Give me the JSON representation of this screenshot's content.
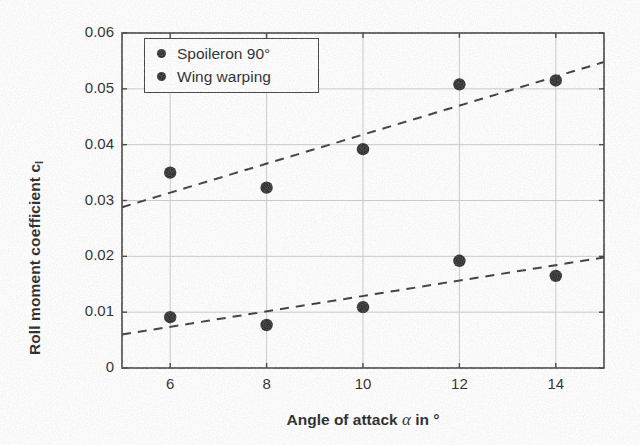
{
  "chart_data": {
    "type": "scatter",
    "title": "",
    "xlabel": "Angle of attack α in °",
    "ylabel": "Roll moment coefficient c",
    "ylabel_sub": "l",
    "xlabel_prefix": "Angle of attack ",
    "xlabel_symbol": "α",
    "xlabel_suffix": " in °",
    "x": [
      6,
      8,
      10,
      12,
      14
    ],
    "xlim": [
      5,
      15
    ],
    "ylim": [
      0,
      0.06
    ],
    "xticks": [
      6,
      8,
      10,
      12,
      14
    ],
    "xticklabels": [
      "6",
      "8",
      "10",
      "12",
      "14"
    ],
    "yticks": [
      0,
      0.01,
      0.02,
      0.03,
      0.04,
      0.05,
      0.06
    ],
    "yticklabels": [
      "0",
      "0.01",
      "0.02",
      "0.03",
      "0.04",
      "0.05",
      "0.06"
    ],
    "grid": true,
    "legend_position": "top-left-inside",
    "marker": "filled-circle",
    "marker_color": "#2b2b2b",
    "trendline_style": "dashed",
    "trendline_color": "#333333",
    "series": [
      {
        "name": "Spoileron 90°",
        "values": [
          0.035,
          0.0323,
          0.0392,
          0.0508,
          0.0515
        ],
        "trendline": {
          "x": [
            5,
            15
          ],
          "y": [
            0.0288,
            0.0548
          ]
        }
      },
      {
        "name": "Wing warping",
        "values": [
          0.0091,
          0.0077,
          0.0109,
          0.0192,
          0.0165
        ],
        "trendline": {
          "x": [
            5,
            15
          ],
          "y": [
            0.006,
            0.0198
          ]
        }
      }
    ]
  },
  "legend": {
    "items": [
      {
        "label": "Spoileron 90°"
      },
      {
        "label": "Wing warping"
      }
    ]
  },
  "colors": {
    "axis": "#3a3a3a",
    "grid": "#c9c9c9",
    "marker": "#2b2b2b",
    "text": "#1d1d1d",
    "background": "#ffffff"
  }
}
